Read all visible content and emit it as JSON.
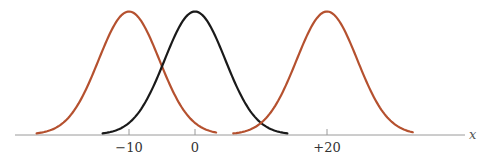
{
  "chart_data": {
    "type": "line",
    "title": "",
    "xlabel": "x",
    "ylabel": "",
    "xlim": [
      -27,
      40
    ],
    "grid": false,
    "legend": null,
    "x_ticks": [
      {
        "value": -10,
        "label": "−10"
      },
      {
        "value": 0,
        "label": "0"
      },
      {
        "value": 20,
        "label": "+20"
      }
    ],
    "series": [
      {
        "name": "gaussian-left",
        "shape": "normal",
        "mean": -10,
        "sigma": 4.6,
        "x_range": [
          -24,
          3.2
        ],
        "color": "#b5512f"
      },
      {
        "name": "gaussian-center",
        "shape": "normal",
        "mean": 0,
        "sigma": 4.6,
        "x_range": [
          -14,
          14
        ],
        "color": "#1a1a1a"
      },
      {
        "name": "gaussian-right",
        "shape": "normal",
        "mean": 20,
        "sigma": 4.6,
        "x_range": [
          5.8,
          33
        ],
        "color": "#b5512f"
      }
    ]
  },
  "layout": {
    "origin_px": 195,
    "px_per_unit": 6.6,
    "axis_y_px": 135,
    "peak_y_px": 12,
    "axis_x_start_px": 15,
    "axis_x_end_px": 465,
    "axis_color": "#9a9a9a"
  }
}
